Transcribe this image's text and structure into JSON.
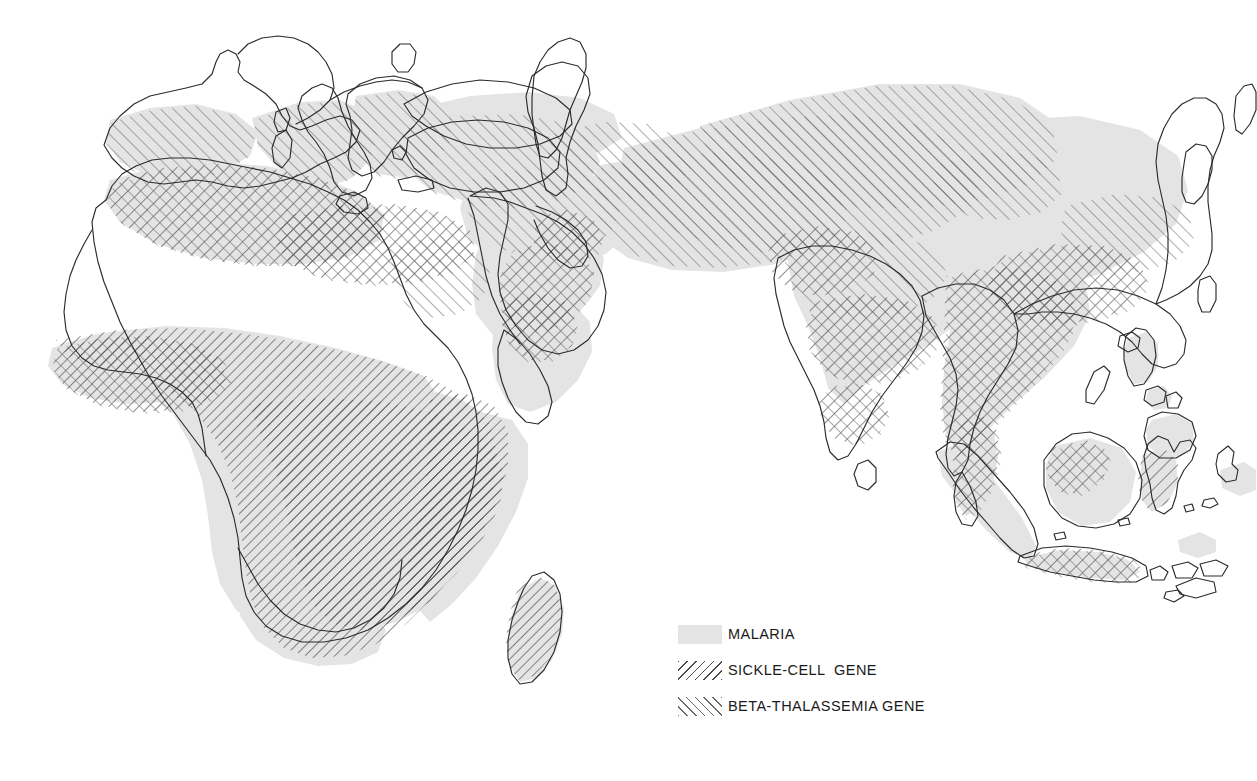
{
  "figure": {
    "background_color": "#ffffff",
    "width": 1257,
    "height": 781
  },
  "colors": {
    "malaria_fill": "#e4e4e4",
    "coastline_stroke": "#2b2b2b",
    "sickle_hatch": "#4a4a4a",
    "beta_hatch": "#6a6a6a",
    "label_text": "#1a1a1a"
  },
  "legend": {
    "items": [
      {
        "swatch": "solid-gray-fill-swatch",
        "label": "MALARIA",
        "pattern": "solid",
        "color": "#e4e4e4"
      },
      {
        "swatch": "backslash-hatch-swatch",
        "label": "SICKLE-CELL  GENE",
        "pattern": "backslash-hatch",
        "color": "#4a4a4a"
      },
      {
        "swatch": "forwardslash-hatch-swatch",
        "label": "BETA-THALASSEMIA GENE",
        "pattern": "forwardslash-hatch",
        "color": "#6a6a6a"
      }
    ]
  },
  "map": {
    "projection_note": "Old World: Europe, Africa, Asia, Southeast Asian archipelago",
    "regions": [
      {
        "name": "Iberian Peninsula",
        "malaria": true,
        "beta_thalassemia": true,
        "sickle_cell": false
      },
      {
        "name": "Southern France / Italy",
        "malaria": true,
        "beta_thalassemia": true,
        "sickle_cell": false
      },
      {
        "name": "Greece / Balkans",
        "malaria": true,
        "beta_thalassemia": true,
        "sickle_cell": false
      },
      {
        "name": "Turkey / Anatolia",
        "malaria": true,
        "beta_thalassemia": true,
        "sickle_cell": false
      },
      {
        "name": "North Africa (Maghreb)",
        "malaria": true,
        "beta_thalassemia": true,
        "sickle_cell": true
      },
      {
        "name": "Libya / Egypt coast",
        "malaria": true,
        "beta_thalassemia": true,
        "sickle_cell": true
      },
      {
        "name": "Sahara",
        "malaria": false,
        "beta_thalassemia": false,
        "sickle_cell": false
      },
      {
        "name": "West Africa",
        "malaria": true,
        "beta_thalassemia": true,
        "sickle_cell": true
      },
      {
        "name": "Sub-Saharan / Central Africa",
        "malaria": true,
        "beta_thalassemia": false,
        "sickle_cell": true
      },
      {
        "name": "East Africa",
        "malaria": true,
        "beta_thalassemia": false,
        "sickle_cell": true
      },
      {
        "name": "Southern Africa",
        "malaria": false,
        "beta_thalassemia": false,
        "sickle_cell": false
      },
      {
        "name": "Madagascar",
        "malaria": true,
        "beta_thalassemia": false,
        "sickle_cell": true
      },
      {
        "name": "Arabian Peninsula (east & south)",
        "malaria": true,
        "beta_thalassemia": true,
        "sickle_cell": true
      },
      {
        "name": "Mesopotamia / Iran",
        "malaria": true,
        "beta_thalassemia": true,
        "sickle_cell": false
      },
      {
        "name": "Central Asia",
        "malaria": true,
        "beta_thalassemia": true,
        "sickle_cell": false
      },
      {
        "name": "India",
        "malaria": true,
        "beta_thalassemia": true,
        "sickle_cell": true
      },
      {
        "name": "Southeast Asia (Indochina)",
        "malaria": true,
        "beta_thalassemia": true,
        "sickle_cell": true
      },
      {
        "name": "Southern China",
        "malaria": true,
        "beta_thalassemia": true,
        "sickle_cell": false
      },
      {
        "name": "Malay Peninsula / Sumatra / Java / Borneo",
        "malaria": true,
        "beta_thalassemia": true,
        "sickle_cell": false
      },
      {
        "name": "Philippines",
        "malaria": true,
        "beta_thalassemia": false,
        "sickle_cell": false
      },
      {
        "name": "Northern Europe",
        "malaria": false,
        "beta_thalassemia": false,
        "sickle_cell": false
      },
      {
        "name": "Korea / Japan / Northern China",
        "malaria": false,
        "beta_thalassemia": false,
        "sickle_cell": false
      }
    ]
  }
}
